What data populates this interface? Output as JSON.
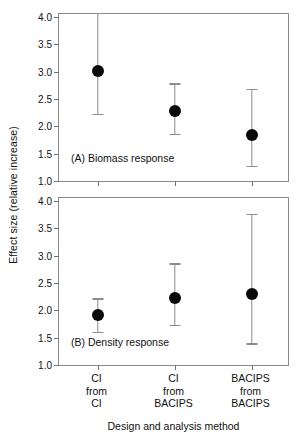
{
  "chart_data": {
    "type": "scatter",
    "title": "",
    "xlabel": "Design and analysis method",
    "ylabel": "Effect size (relative increase)",
    "categories": [
      "CI\nfrom\nCI",
      "CI\nfrom\nBACIPS",
      "BACIPS\nfrom\nBACIPS"
    ],
    "category_lines": [
      [
        "CI",
        "from",
        "CI"
      ],
      [
        "CI",
        "from",
        "BACIPS"
      ],
      [
        "BACIPS",
        "from",
        "BACIPS"
      ]
    ],
    "ylim": [
      1.0,
      4.0
    ],
    "yticks": [
      1.0,
      1.5,
      2.0,
      2.5,
      3.0,
      3.5,
      4.0
    ],
    "ytick_labels": [
      "1.0",
      "1.5",
      "2.0",
      "2.5",
      "3.0",
      "3.5",
      "4.0"
    ],
    "grid": false,
    "legend": "none",
    "marker_color": "#0a0a0a",
    "errorbar_color": "#8c8c8c",
    "axis_color": "#8a8a8a",
    "panels": [
      {
        "id": "A",
        "caption": "(A) Biomass response",
        "points": [
          {
            "category": "CI from CI",
            "value": 3.02,
            "lower": 2.23,
            "upper": 4.08
          },
          {
            "category": "CI from BACIPS",
            "value": 2.28,
            "lower": 1.86,
            "upper": 2.79
          },
          {
            "category": "BACIPS from BACIPS",
            "value": 1.85,
            "lower": 1.28,
            "upper": 2.69
          }
        ]
      },
      {
        "id": "B",
        "caption": "(B) Density response",
        "points": [
          {
            "category": "CI from CI",
            "value": 1.92,
            "lower": 1.61,
            "upper": 2.22
          },
          {
            "category": "CI from BACIPS",
            "value": 2.22,
            "lower": 1.73,
            "upper": 2.86
          },
          {
            "category": "BACIPS from BACIPS",
            "value": 2.29,
            "lower": 1.4,
            "upper": 3.77
          }
        ]
      }
    ]
  }
}
